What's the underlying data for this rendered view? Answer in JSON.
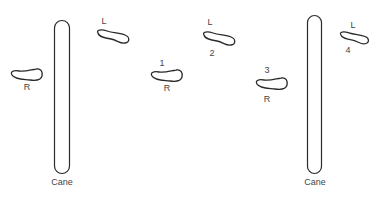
{
  "diagram": {
    "stroke_color": "#2a2a2a",
    "canes": [
      {
        "label": "Cane",
        "x": 54,
        "y": 20,
        "w": 16,
        "h": 154,
        "label_x": 62,
        "label_y": 178
      },
      {
        "label": "Cane",
        "x": 307,
        "y": 15,
        "w": 15,
        "h": 159,
        "label_x": 315,
        "label_y": 178
      }
    ],
    "feet": [
      {
        "side": "R",
        "step": "",
        "x": 10,
        "y": 69,
        "side_label_pos": "below",
        "side_x": 27,
        "side_y": 83
      },
      {
        "side": "L",
        "step": "",
        "x": 96,
        "y": 30,
        "side_label_pos": "above",
        "side_x": 104,
        "side_y": 17
      },
      {
        "side": "R",
        "step": "1",
        "x": 150,
        "y": 69,
        "side_x": 167,
        "side_y": 84,
        "step_x": 162,
        "step_y": 59
      },
      {
        "side": "L",
        "step": "2",
        "x": 202,
        "y": 32,
        "side_x": 210,
        "side_y": 18,
        "step_x": 212,
        "step_y": 49
      },
      {
        "side": "R",
        "step": "3",
        "x": 255,
        "y": 78,
        "side_x": 267,
        "side_y": 95,
        "step_x": 267,
        "step_y": 66
      },
      {
        "side": "L",
        "step": "4",
        "x": 339,
        "y": 33,
        "side_x": 353,
        "side_y": 21,
        "step_x": 348,
        "step_y": 46
      }
    ],
    "labels": {
      "cane_left": "Cane",
      "cane_right": "Cane",
      "foot0_side": "R",
      "foot1_side": "L",
      "foot2_step": "1",
      "foot2_side": "R",
      "foot3_side": "L",
      "foot3_step": "2",
      "foot4_step": "3",
      "foot4_side": "R",
      "foot5_side": "L",
      "foot5_step": "4"
    }
  }
}
